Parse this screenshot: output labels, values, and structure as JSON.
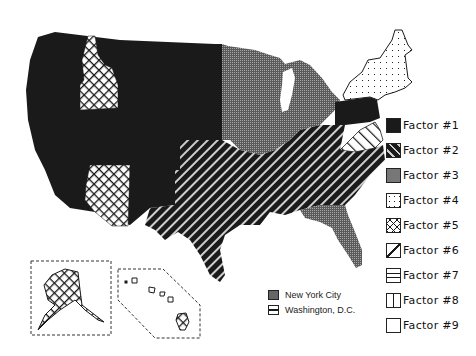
{
  "map": {
    "type": "choropleth",
    "region": "United States",
    "inset_labels": [
      "Alaska",
      "Hawaii"
    ]
  },
  "legend": {
    "items": [
      {
        "label": "Factor #1",
        "pattern": "solid-black"
      },
      {
        "label": "Factor #2",
        "pattern": "diagonal-stripes-dark"
      },
      {
        "label": "Factor #3",
        "pattern": "gray-stipple"
      },
      {
        "label": "Factor #4",
        "pattern": "sparse-dots"
      },
      {
        "label": "Factor #5",
        "pattern": "crosshatch"
      },
      {
        "label": "Factor #6",
        "pattern": "diagonal-light"
      },
      {
        "label": "Factor #7",
        "pattern": "horizontal-lines"
      },
      {
        "label": "Factor #8",
        "pattern": "vertical-lines"
      },
      {
        "label": "Factor #9",
        "pattern": "blank"
      }
    ]
  },
  "city_legend": {
    "items": [
      {
        "label": "New York City",
        "pattern": "gray-stipple"
      },
      {
        "label": "Washington, D.C.",
        "pattern": "horizontal-lines"
      }
    ]
  },
  "regions": {
    "factor_1": [
      "West (WA, OR, CA, NV, UT, MT, WY, CO, NM, ND, SD, NE, KS)",
      "Pennsylvania"
    ],
    "factor_2": [
      "South (TX, OK, AR, LA, MS, AL, GA, TN, KY, SC, NC, MO south)"
    ],
    "factor_3": [
      "Midwest (MN, WI, IA, IL, IN, MI, OH, MO)",
      "Florida"
    ],
    "factor_4": [
      "New England & New York"
    ],
    "factor_5": [
      "Idaho",
      "Arizona",
      "Alaska"
    ],
    "factor_6": [
      "Virginia"
    ],
    "factor_9": [
      "Hawaii (most islands)"
    ]
  },
  "colors": {
    "ink": "#1a1a1a",
    "gray": "#777777",
    "background": "#ffffff"
  }
}
